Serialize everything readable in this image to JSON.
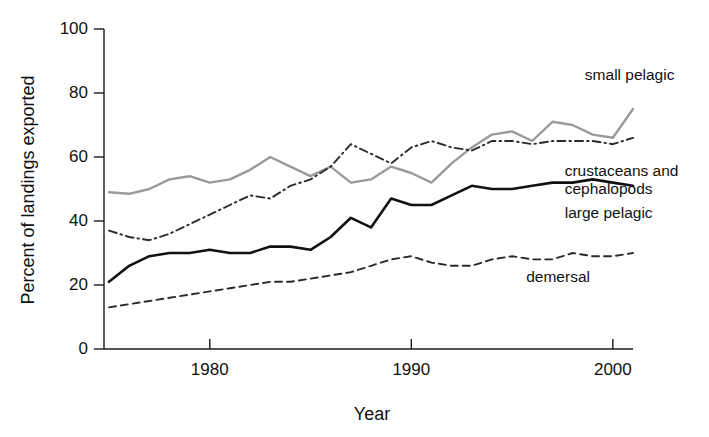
{
  "chart_data": {
    "type": "line",
    "title": "",
    "xlabel": "Year",
    "ylabel": "Percent of landings exported",
    "xlim": [
      1974,
      2001
    ],
    "ylim": [
      0,
      100
    ],
    "grid": false,
    "legend_position": "inline-right-annotations",
    "x_ticks": [
      "1980",
      "1990",
      "2000"
    ],
    "x_tick_values": [
      1980,
      1990,
      2000
    ],
    "y_ticks": [
      "0",
      "20",
      "40",
      "60",
      "80",
      "100"
    ],
    "y_tick_values": [
      0,
      20,
      40,
      60,
      80,
      100
    ],
    "x": [
      1975,
      1976,
      1977,
      1978,
      1979,
      1980,
      1981,
      1982,
      1983,
      1984,
      1985,
      1986,
      1987,
      1988,
      1989,
      1990,
      1991,
      1992,
      1993,
      1994,
      1995,
      1996,
      1997,
      1998,
      1999,
      2000,
      2001
    ],
    "series": [
      {
        "name": "small pelagic",
        "color": "#9a9a9a",
        "style": "solid",
        "label_x": 2000,
        "label_y": 84,
        "values": [
          49,
          48.5,
          50,
          53,
          54,
          52,
          53,
          56,
          60,
          57,
          54,
          57,
          52,
          53,
          57,
          55,
          52,
          58,
          63,
          67,
          68,
          65,
          71,
          70,
          67,
          66,
          75
        ]
      },
      {
        "name": "crustaceans and cephalopods",
        "color": "#2a2a2a",
        "style": "dashdot",
        "label_x": 1999,
        "label_y": 54,
        "values": [
          37,
          35,
          34,
          36,
          39,
          42,
          45,
          48,
          47,
          51,
          53,
          57,
          64,
          61,
          58,
          63,
          65,
          63,
          62,
          65,
          65,
          64,
          65,
          65,
          65,
          64,
          66
        ]
      },
      {
        "name": "large pelagic",
        "color": "#111111",
        "style": "solid",
        "label_x": 1999,
        "label_y": 41,
        "values": [
          21,
          26,
          29,
          30,
          30,
          31,
          30,
          30,
          32,
          32,
          31,
          35,
          41,
          38,
          47,
          45,
          45,
          48,
          51,
          50,
          50,
          51,
          52,
          52,
          53,
          52,
          51
        ]
      },
      {
        "name": "demersal",
        "color": "#2a2a2a",
        "style": "dashed",
        "label_x": 1996,
        "label_y": 21,
        "values": [
          13,
          14,
          15,
          16,
          17,
          18,
          19,
          20,
          21,
          21,
          22,
          23,
          24,
          26,
          28,
          29,
          27,
          26,
          26,
          28,
          29,
          28,
          28,
          30,
          29,
          29,
          30
        ]
      }
    ]
  }
}
